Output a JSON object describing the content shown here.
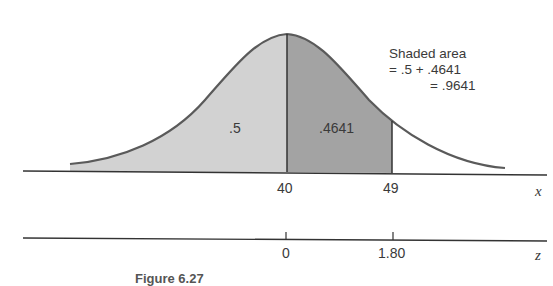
{
  "figure": {
    "annotation": {
      "line1": "Shaded area",
      "line2": "= .5 + .4641",
      "line3": "= .9641"
    },
    "region_labels": {
      "left": ".5",
      "right": ".4641"
    },
    "x_axis": {
      "label": "x",
      "ticks": [
        "40",
        "49"
      ]
    },
    "z_axis": {
      "label": "z",
      "ticks": [
        "0",
        "1.80"
      ]
    },
    "caption": "Figure 6.27"
  },
  "colors": {
    "left_shade": "#d2d2d2",
    "right_shade": "#a3a3a3",
    "curve": "#5a5a5a",
    "axis": "#333333"
  }
}
